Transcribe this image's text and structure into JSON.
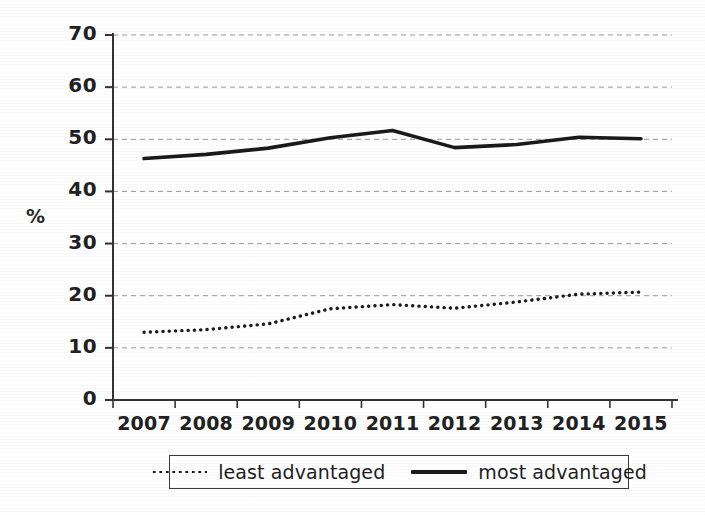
{
  "chart_data": {
    "type": "line",
    "title": "",
    "xlabel": "",
    "ylabel": "%",
    "categories": [
      "2007",
      "2008",
      "2009",
      "2010",
      "2011",
      "2012",
      "2013",
      "2014",
      "2015"
    ],
    "ylim": [
      0,
      70
    ],
    "yticks": [
      "0",
      "10",
      "20",
      "30",
      "40",
      "50",
      "60",
      "70"
    ],
    "ytick_values": [
      0,
      10,
      20,
      30,
      40,
      50,
      60,
      70
    ],
    "grid": "horizontal-dashed",
    "legend_position": "below-axis",
    "series": [
      {
        "name": "least advantaged",
        "style": "dotted",
        "color": "#1a1a1a",
        "values": [
          13.0,
          13.5,
          14.6,
          17.5,
          18.3,
          17.6,
          18.8,
          20.3,
          20.7
        ]
      },
      {
        "name": "most advantaged",
        "style": "solid",
        "color": "#1a1a1a",
        "values": [
          46.3,
          47.1,
          48.3,
          50.3,
          51.7,
          48.4,
          49.0,
          50.4,
          50.1
        ]
      }
    ]
  },
  "axis": {
    "y_title": "%"
  },
  "legend": {
    "entries": [
      {
        "label": "least advantaged",
        "marker": "dotted-line-swatch"
      },
      {
        "label": "most advantaged",
        "marker": "solid-line-swatch"
      }
    ]
  }
}
